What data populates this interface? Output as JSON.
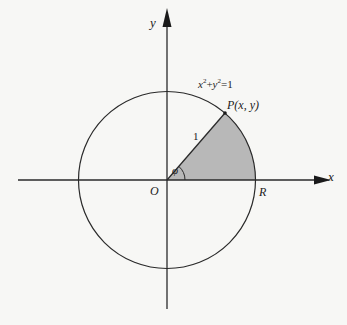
{
  "diagram": {
    "type": "unit-circle-sector",
    "equation_label": {
      "base_x": "x",
      "sup1": "2",
      "plus": "+",
      "base_y": "y",
      "sup2": "2",
      "rhs": "=1"
    },
    "point_label": "P(x, y)",
    "radius_label": "1",
    "angle_label": "φ",
    "origin_label": "O",
    "r_label": "R",
    "x_axis_label": "x",
    "y_axis_label": "y",
    "colors": {
      "stroke": "#2a2a2a",
      "sector_fill": "#b8b8b8",
      "background": "#f7f7f5"
    }
  }
}
